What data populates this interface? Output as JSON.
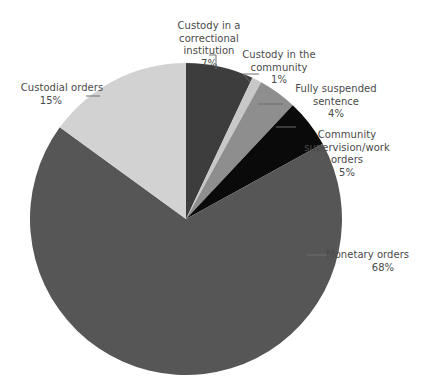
{
  "chart_data": {
    "type": "pie",
    "title": "",
    "subtitle": "",
    "xlabel": "",
    "ylabel": "",
    "legend_position": "none",
    "grid": false,
    "labels_position": "outside-with-leader-lines",
    "start_angle_deg": 0,
    "direction": "clockwise",
    "total_percent": 100,
    "categories": [
      "Custody in a correctional institution",
      "Custody in the community",
      "Fully suspended sentence",
      "Community supervision/work orders",
      "Monetary orders",
      "Custodial orders"
    ],
    "values": [
      7,
      1,
      4,
      5,
      68,
      15
    ],
    "value_labels": [
      "7%",
      "1%",
      "4%",
      "5%",
      "68%",
      "15%"
    ],
    "colors": [
      "#3d3d3d",
      "#c8c8c8",
      "#8e8e8e",
      "#0a0a0a",
      "#565656",
      "#d2d2d2"
    ],
    "slices": [
      {
        "name": "Custody in a correctional institution",
        "value": 7,
        "value_label": "7%",
        "color": "#3d3d3d",
        "label_lines": [
          "Custody in a",
          "correctional",
          "institution"
        ]
      },
      {
        "name": "Custody in the community",
        "value": 1,
        "value_label": "1%",
        "color": "#c8c8c8",
        "label_lines": [
          "Custody in the",
          "community"
        ]
      },
      {
        "name": "Fully suspended sentence",
        "value": 4,
        "value_label": "4%",
        "color": "#8e8e8e",
        "label_lines": [
          "Fully suspended",
          "sentence"
        ]
      },
      {
        "name": "Community supervision/work orders",
        "value": 5,
        "value_label": "5%",
        "color": "#0a0a0a",
        "label_lines": [
          "Community",
          "supervision/work",
          "orders"
        ]
      },
      {
        "name": "Monetary orders",
        "value": 68,
        "value_label": "68%",
        "color": "#565656",
        "label_lines": [
          "Monetary orders"
        ]
      },
      {
        "name": "Custodial orders",
        "value": 15,
        "value_label": "15%",
        "color": "#d2d2d2",
        "label_lines": [
          "Custodial orders"
        ]
      }
    ]
  },
  "labels": {
    "custody_correctional": {
      "text": "Custody in a\ncorrectional\ninstitution",
      "percent": "7%"
    },
    "custody_community": {
      "text": "Custody in the\ncommunity",
      "percent": "1%"
    },
    "fully_suspended": {
      "text": "Fully suspended\nsentence",
      "percent": "4%"
    },
    "community_supervision": {
      "text": "Community\nsupervision/work\norders",
      "percent": "5%"
    },
    "monetary_orders": {
      "text": "Monetary orders",
      "percent": "68%"
    },
    "custodial_orders": {
      "text": "Custodial orders",
      "percent": "15%"
    }
  },
  "style": {
    "background": "#ffffff",
    "text_color": "#4a4a4a",
    "leader_line_color": "#6f6f6f"
  }
}
